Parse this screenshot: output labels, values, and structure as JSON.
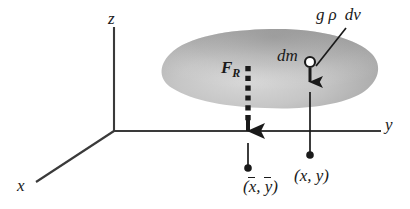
{
  "figure": {
    "background_color": "#ffffff",
    "ink_color": "#1a1a1a",
    "body_fill_color": "#b3b3b3",
    "axes": {
      "x_label": "x",
      "y_label": "y",
      "z_label": "z",
      "origin": {
        "x": 114,
        "y": 131
      }
    },
    "labels": {
      "resultant_force": "F",
      "resultant_force_subscript": "R",
      "mass_element": "dm",
      "weight_of_element_g": "g",
      "weight_of_element_rho": "ρ",
      "weight_of_element_dv": "dv",
      "centroid_open": "(",
      "centroid_x": "x",
      "centroid_sep": ", ",
      "centroid_y": "y",
      "centroid_close": ")",
      "point_open": "(",
      "point_x": "x",
      "point_sep": ", ",
      "point_y": "y",
      "point_close": ")"
    },
    "markers": {
      "dm_circle": {
        "x": 310,
        "y": 62,
        "r": 5,
        "style": "open-circle"
      },
      "centroid_dot": {
        "x": 248,
        "y": 168,
        "r": 3.6,
        "style": "filled-dot"
      },
      "point_dot": {
        "x": 310,
        "y": 155,
        "r": 3.6,
        "style": "filled-dot"
      }
    },
    "arrows": {
      "resultant_force": {
        "style": "square-dashed",
        "x": 248,
        "from_y": 66,
        "to_y": 143
      },
      "element_weight": {
        "style": "solid",
        "x": 310,
        "from_y": 62,
        "to_y": 92
      }
    }
  }
}
